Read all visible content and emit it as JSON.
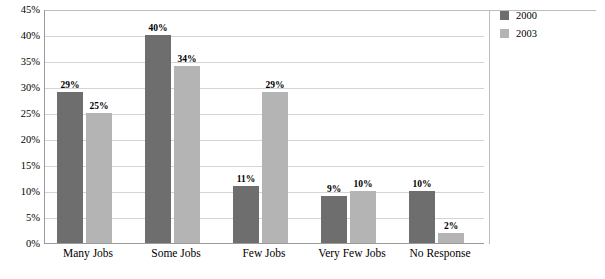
{
  "chart_data": {
    "type": "bar",
    "title": "",
    "xlabel": "",
    "ylabel": "",
    "categories": [
      "Many Jobs",
      "Some Jobs",
      "Few Jobs",
      "Very Few Jobs",
      "No Response"
    ],
    "series": [
      {
        "name": "2000",
        "color": "#6e6e6e",
        "values": [
          29,
          40,
          11,
          9,
          10
        ],
        "labels": [
          "29%",
          "40%",
          "11%",
          "9%",
          "10%"
        ]
      },
      {
        "name": "2003",
        "color": "#b4b4b4",
        "values": [
          25,
          34,
          29,
          10,
          2
        ],
        "labels": [
          "25%",
          "34%",
          "29%",
          "10%",
          "2%"
        ]
      }
    ],
    "ylim": [
      0,
      45
    ],
    "ytick_values": [
      0,
      5,
      10,
      15,
      20,
      25,
      30,
      35,
      40,
      45
    ],
    "ytick_labels": [
      "0%",
      "5%",
      "10%",
      "15%",
      "20%",
      "25%",
      "30%",
      "35%",
      "40%",
      "45%"
    ],
    "grid": true,
    "legend_position": "right",
    "legend": [
      "2000",
      "2003"
    ]
  }
}
